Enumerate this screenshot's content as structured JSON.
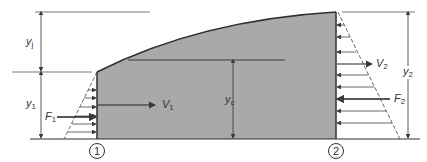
{
  "diagram": {
    "type": "hydraulic-jump-control-volume",
    "colors": {
      "water": "#a9a9a9",
      "line": "#3a3a3a",
      "background": "#ffffff"
    },
    "labels": {
      "yj": {
        "sym": "y",
        "sub": "j"
      },
      "y1": {
        "sym": "y",
        "sub": "1"
      },
      "F1": {
        "sym": "F",
        "sub": "1"
      },
      "V1": {
        "sym": "V",
        "sub": "1"
      },
      "yc": {
        "sym": "y",
        "sub": "c"
      },
      "V2": {
        "sym": "V",
        "sub": "2"
      },
      "y2": {
        "sym": "y",
        "sub": "2"
      },
      "F2": {
        "sym": "F",
        "sub": "2"
      }
    },
    "sections": {
      "one": "1",
      "two": "2"
    }
  }
}
